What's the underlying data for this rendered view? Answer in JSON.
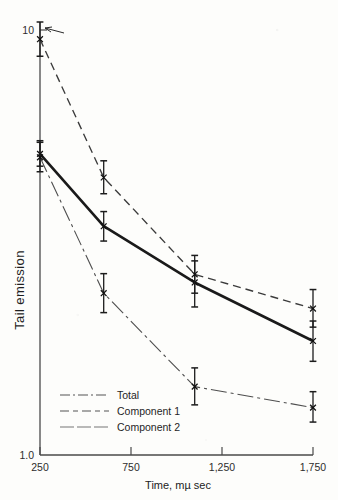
{
  "chart_data": {
    "type": "line",
    "title": "",
    "subtitle": "",
    "xlabel": "Time, mµ sec",
    "ylabel": "Tail emission",
    "xlim": [
      250,
      1750
    ],
    "ylim": [
      1.0,
      11.0
    ],
    "yscale": "log",
    "grid": false,
    "legend_position": "lower-left-inside",
    "x_tick_labels": [
      "250",
      "750",
      "1,250",
      "1,750"
    ],
    "x_tick_values": [
      250,
      750,
      1250,
      1750
    ],
    "y_tick_labels": [
      "10",
      "1.0"
    ],
    "y_tick_values": [
      10,
      1.0
    ],
    "x": [
      250,
      600,
      1100,
      1750
    ],
    "series": [
      {
        "name": "Total",
        "style": "solid-thick",
        "values": [
          5.3,
          3.55,
          2.6,
          1.88
        ],
        "err_low": [
          0.35,
          0.28,
          0.33,
          0.2
        ],
        "err_high": [
          0.4,
          0.3,
          0.33,
          0.22
        ]
      },
      {
        "name": "Component 1",
        "style": "dashed",
        "values": [
          10.0,
          4.65,
          2.72,
          2.25
        ],
        "err_low": [
          0.9,
          0.4,
          0.27,
          0.22
        ],
        "err_high": [
          1.0,
          0.45,
          0.3,
          0.25
        ]
      },
      {
        "name": "Component 2",
        "style": "dash-dot",
        "values": [
          5.2,
          2.45,
          1.46,
          1.3
        ],
        "err_low": [
          0.4,
          0.25,
          0.14,
          0.1
        ],
        "err_high": [
          0.45,
          0.28,
          0.16,
          0.12
        ]
      }
    ],
    "annotations": [
      {
        "kind": "pointer-arrow",
        "target_series": "Component 1",
        "target_x": 250
      }
    ]
  },
  "legend": {
    "entries": [
      {
        "label": "Total"
      },
      {
        "label": "Component 1"
      },
      {
        "label": "Component 2"
      }
    ]
  },
  "axes": {
    "y_title": "Tail emission",
    "x_title": "Time, mµ sec",
    "y_top_label": "10",
    "y_bottom_label": "1.0",
    "x_labels": [
      "250",
      "750",
      "1,250",
      "1,750"
    ]
  }
}
